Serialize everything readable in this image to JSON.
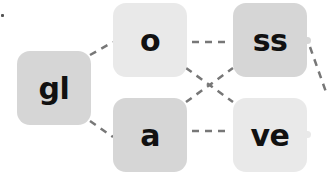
{
  "diagram": {
    "type": "word-building-puzzle",
    "colors": {
      "tile_dark": "#d6d6d6",
      "tile_light": "#e9e9e9",
      "text": "#111111",
      "connector": "#777777"
    },
    "tiles": [
      {
        "id": "gl",
        "label": "gl",
        "shade": "dark"
      },
      {
        "id": "o",
        "label": "o",
        "shade": "light"
      },
      {
        "id": "a",
        "label": "a",
        "shade": "dark"
      },
      {
        "id": "ss",
        "label": "ss",
        "shade": "dark"
      },
      {
        "id": "ve",
        "label": "ve",
        "shade": "light"
      }
    ],
    "connections": [
      {
        "from": "gl",
        "to": "o"
      },
      {
        "from": "gl",
        "to": "a"
      },
      {
        "from": "o",
        "to": "ss"
      },
      {
        "from": "o",
        "to": "ve"
      },
      {
        "from": "a",
        "to": "ss"
      },
      {
        "from": "a",
        "to": "ve"
      },
      {
        "from": "ss",
        "to": "offscreen-right"
      }
    ]
  }
}
